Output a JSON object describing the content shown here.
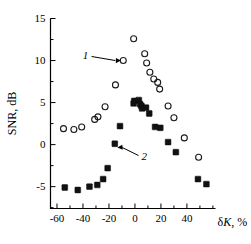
{
  "chart_data": {
    "type": "scatter",
    "title": "",
    "xlabel": "δK, %",
    "ylabel": "SNR, dB",
    "xlim": [
      -65,
      62
    ],
    "ylim": [
      -7.6,
      15
    ],
    "grid": false,
    "legend_position": "inline-annotations",
    "xticks": [
      -60,
      -50,
      -40,
      -30,
      -20,
      -10,
      0,
      10,
      20,
      30,
      40,
      50,
      60
    ],
    "xticklabels": [
      "-60",
      "",
      "-40",
      "",
      "-20",
      "",
      "0",
      "",
      "20",
      "",
      "40",
      "",
      ""
    ],
    "yticks": [
      -7.5,
      -5,
      -2.5,
      0,
      2.5,
      5,
      7.5,
      10,
      12.5,
      15
    ],
    "yticklabels": [
      "",
      "-5",
      "",
      "0",
      "",
      "5",
      "",
      "10",
      "",
      "15"
    ],
    "series": [
      {
        "name": "1",
        "marker": "open-circle",
        "color": "#1a1a1a",
        "points": [
          [
            -55.0,
            1.9
          ],
          [
            -47.0,
            1.8
          ],
          [
            -41.0,
            2.1
          ],
          [
            -31.0,
            3.0
          ],
          [
            -28.5,
            3.3
          ],
          [
            -23.0,
            4.5
          ],
          [
            -15.0,
            7.1
          ],
          [
            -9.0,
            10.0
          ],
          [
            -1.0,
            12.6
          ],
          [
            7.5,
            10.8
          ],
          [
            9.0,
            9.7
          ],
          [
            11.5,
            8.6
          ],
          [
            14.5,
            7.8
          ],
          [
            17.5,
            7.4
          ],
          [
            19.0,
            6.6
          ],
          [
            25.5,
            4.6
          ],
          [
            30.0,
            3.2
          ],
          [
            38.0,
            0.8
          ],
          [
            49.0,
            -1.5
          ]
        ]
      },
      {
        "name": "2",
        "marker": "filled-square",
        "color": "#111111",
        "points": [
          [
            -54.0,
            -5.1
          ],
          [
            -44.0,
            -5.4
          ],
          [
            -35.0,
            -5.0
          ],
          [
            -29.0,
            -4.8
          ],
          [
            -24.5,
            -4.1
          ],
          [
            -21.0,
            -2.8
          ],
          [
            -15.5,
            0.1
          ],
          [
            -11.5,
            2.2
          ],
          [
            -1.0,
            4.9
          ],
          [
            -0.5,
            5.2
          ],
          [
            3.0,
            5.3
          ],
          [
            4.0,
            4.8
          ],
          [
            5.0,
            4.6
          ],
          [
            5.5,
            4.3
          ],
          [
            8.5,
            4.4
          ],
          [
            11.0,
            3.7
          ],
          [
            15.5,
            2.1
          ],
          [
            19.5,
            2.0
          ],
          [
            25.5,
            0.3
          ],
          [
            31.5,
            -0.9
          ],
          [
            48.5,
            -4.1
          ],
          [
            55.0,
            -4.7
          ]
        ]
      }
    ],
    "annotations": [
      {
        "label": "1",
        "label_x": -38.0,
        "label_y": 10.6,
        "arrow_to_x": -12.0,
        "arrow_to_y": 10.0
      },
      {
        "label": "2",
        "label_x": 2.0,
        "label_y": -1.3,
        "arrow_to_x": -14.0,
        "arrow_to_y": -0.2
      }
    ]
  }
}
